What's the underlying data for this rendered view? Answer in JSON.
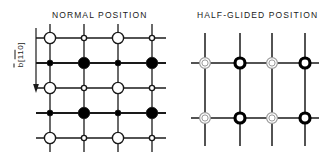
{
  "figure": {
    "width": 327,
    "height": 158,
    "background": "#ffffff",
    "line_color": "#1a1a1a",
    "fill_color": "#000000",
    "open_fill": "#ffffff",
    "faint_color": "#9a9a9a"
  },
  "axis": {
    "name": "b-axis-indicator",
    "symbol": "b",
    "direction_index": "110",
    "direction_overline": "11",
    "bracket_open": "[",
    "bracket_close": "]",
    "arrow_direction": "down"
  },
  "panels": [
    {
      "id": "normal",
      "title": "NORMAL POSITION",
      "grid": {
        "cols_x": [
          14,
          48,
          82,
          116
        ],
        "rows_y": [
          16,
          41,
          66,
          91,
          116
        ],
        "line_extend": 14,
        "h_line_weight": [
          1.3,
          2.2,
          1.3,
          2.2,
          1.3
        ],
        "v_line_weight": 1.3
      },
      "rows": [
        {
          "index": 0,
          "type": "open",
          "nodes": [
            {
              "col": 0,
              "style": "large-open",
              "r": 5.6
            },
            {
              "col": 1,
              "style": "small-open",
              "r": 2.6
            },
            {
              "col": 2,
              "style": "large-open",
              "r": 5.6
            },
            {
              "col": 3,
              "style": "small-open",
              "r": 2.6
            }
          ]
        },
        {
          "index": 1,
          "type": "filled",
          "nodes": [
            {
              "col": 0,
              "style": "small-filled",
              "r": 3.0
            },
            {
              "col": 1,
              "style": "large-filled",
              "r": 5.8
            },
            {
              "col": 2,
              "style": "small-filled",
              "r": 3.0
            },
            {
              "col": 3,
              "style": "large-filled",
              "r": 5.8
            }
          ]
        },
        {
          "index": 2,
          "type": "open",
          "nodes": [
            {
              "col": 0,
              "style": "large-open",
              "r": 5.6
            },
            {
              "col": 1,
              "style": "small-open",
              "r": 2.6
            },
            {
              "col": 2,
              "style": "large-open",
              "r": 5.6
            },
            {
              "col": 3,
              "style": "small-open",
              "r": 2.6
            }
          ]
        },
        {
          "index": 3,
          "type": "filled",
          "nodes": [
            {
              "col": 0,
              "style": "small-filled",
              "r": 3.0
            },
            {
              "col": 1,
              "style": "large-filled",
              "r": 5.8
            },
            {
              "col": 2,
              "style": "small-filled",
              "r": 3.0
            },
            {
              "col": 3,
              "style": "large-filled",
              "r": 5.8
            }
          ]
        },
        {
          "index": 4,
          "type": "open",
          "nodes": [
            {
              "col": 0,
              "style": "large-open",
              "r": 5.6
            },
            {
              "col": 1,
              "style": "small-open",
              "r": 2.6
            },
            {
              "col": 2,
              "style": "large-open",
              "r": 5.6
            },
            {
              "col": 3,
              "style": "small-open",
              "r": 2.6
            }
          ]
        }
      ]
    },
    {
      "id": "halfglided",
      "title": "HALF-GLIDED POSITION",
      "grid": {
        "cols_x": [
          19,
          54,
          86,
          119
        ],
        "rows_y": [
          35,
          90
        ],
        "v_extend_top": 30,
        "v_extend_bottom": 28,
        "h_extend": 14,
        "h_line_weight": 1.6,
        "v_line_weight": 1.5
      },
      "rows": [
        {
          "index": 0,
          "nodes": [
            {
              "col": 0,
              "style": "faint-ring",
              "r": 5.4
            },
            {
              "col": 1,
              "style": "bold-ring",
              "r": 5.0
            },
            {
              "col": 2,
              "style": "faint-ring",
              "r": 5.4
            },
            {
              "col": 3,
              "style": "bold-ring",
              "r": 5.0
            }
          ]
        },
        {
          "index": 1,
          "nodes": [
            {
              "col": 0,
              "style": "faint-ring",
              "r": 5.4
            },
            {
              "col": 1,
              "style": "bold-ring",
              "r": 5.0
            },
            {
              "col": 2,
              "style": "faint-ring",
              "r": 5.4
            },
            {
              "col": 3,
              "style": "bold-ring",
              "r": 5.0
            }
          ]
        }
      ]
    }
  ]
}
